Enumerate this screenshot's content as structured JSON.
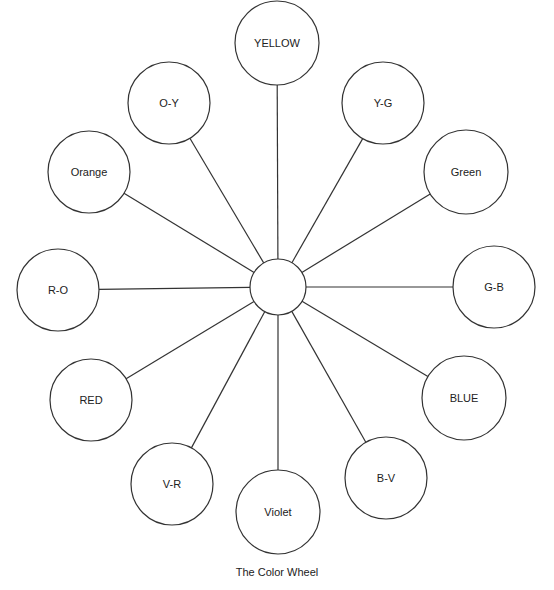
{
  "diagram": {
    "caption": "The Color Wheel",
    "hub": {
      "cx": 278,
      "cy": 287,
      "r": 28
    },
    "stroke_color": "#333333",
    "nodes": [
      {
        "label": "YELLOW",
        "cx": 277,
        "cy": 43,
        "r": 42
      },
      {
        "label": "Y-G",
        "cx": 383,
        "cy": 103,
        "r": 41
      },
      {
        "label": "Green",
        "cx": 466,
        "cy": 172,
        "r": 42
      },
      {
        "label": "G-B",
        "cx": 494,
        "cy": 287,
        "r": 41
      },
      {
        "label": "BLUE",
        "cx": 464,
        "cy": 398,
        "r": 42
      },
      {
        "label": "B-V",
        "cx": 386,
        "cy": 478,
        "r": 41
      },
      {
        "label": "Violet",
        "cx": 278,
        "cy": 512,
        "r": 42
      },
      {
        "label": "V-R",
        "cx": 172,
        "cy": 484,
        "r": 41
      },
      {
        "label": "RED",
        "cx": 91,
        "cy": 400,
        "r": 41
      },
      {
        "label": "R-O",
        "cx": 58,
        "cy": 290,
        "r": 41
      },
      {
        "label": "Orange",
        "cx": 89,
        "cy": 172,
        "r": 41
      },
      {
        "label": "O-Y",
        "cx": 169,
        "cy": 103,
        "r": 41
      }
    ]
  }
}
